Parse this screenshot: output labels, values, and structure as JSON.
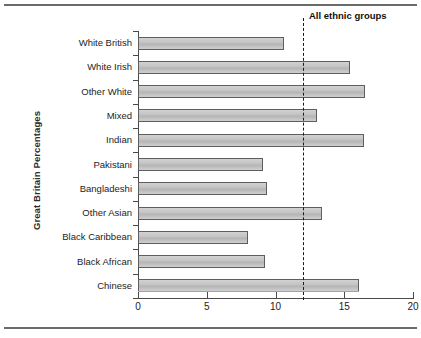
{
  "chart_data": {
    "type": "bar",
    "orientation": "horizontal",
    "title": "",
    "xlabel": "",
    "ylabel": "Great Britain Percentages",
    "xlim": [
      0,
      20
    ],
    "xticks": [
      "0",
      "5",
      "10",
      "15",
      "20"
    ],
    "grid": false,
    "legend": null,
    "categories": [
      "White British",
      "White Irish",
      "Other White",
      "Mixed",
      "Indian",
      "Pakistani",
      "Bangladeshi",
      "Other Asian",
      "Black Caribbean",
      "Black African",
      "Chinese"
    ],
    "values": [
      10.6,
      15.4,
      16.5,
      13.0,
      16.4,
      9.1,
      9.4,
      13.4,
      8.0,
      9.2,
      16.1
    ],
    "annotations": [
      {
        "label": "All ethnic groups",
        "type": "reference-line",
        "style": "dashed",
        "value": 12
      }
    ],
    "colors": {
      "bar_fill": "#c6c6c6",
      "bar_edge": "#5e5e5e",
      "axis": "#4a4a4a",
      "text": "#1d1d1d",
      "reference_line": "#1a1a1a"
    }
  }
}
